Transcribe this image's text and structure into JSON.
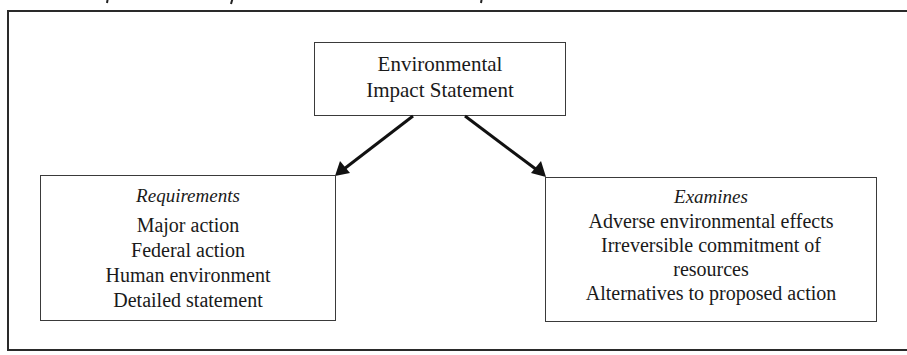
{
  "diagram": {
    "root": {
      "lines": [
        "Environmental",
        "Impact Statement"
      ]
    },
    "left_branch": {
      "heading": "Requirements",
      "items": [
        "Major action",
        "Federal action",
        "Human environment",
        "Detailed statement"
      ]
    },
    "right_branch": {
      "heading": "Examines",
      "items": [
        "Adverse environmental effects",
        "Irreversible commitment of",
        "resources",
        "Alternatives to proposed action"
      ]
    },
    "edges": [
      {
        "from": "Environmental Impact Statement",
        "to": "Requirements"
      },
      {
        "from": "Environmental Impact Statement",
        "to": "Examines"
      }
    ],
    "colors": {
      "line": "#1a1a1a",
      "background": "#ffffff"
    }
  }
}
